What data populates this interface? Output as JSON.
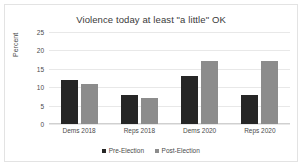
{
  "chart_data": {
    "type": "bar",
    "title": "Violence today at least \"a little\" OK",
    "xlabel": "",
    "ylabel": "Percent",
    "ylim": [
      0,
      25
    ],
    "yticks": [
      0,
      5,
      10,
      15,
      20,
      25
    ],
    "grid": true,
    "legend_position": "bottom-center",
    "categories": [
      "Dems 2018",
      "Reps 2018",
      "Dems 2020",
      "Reps 2020"
    ],
    "series": [
      {
        "name": "Pre-Election",
        "color": "#262626",
        "values": [
          12,
          8,
          13,
          8
        ]
      },
      {
        "name": "Post-Election",
        "color": "#8c8c8c",
        "values": [
          11,
          7,
          17,
          17
        ]
      }
    ]
  }
}
